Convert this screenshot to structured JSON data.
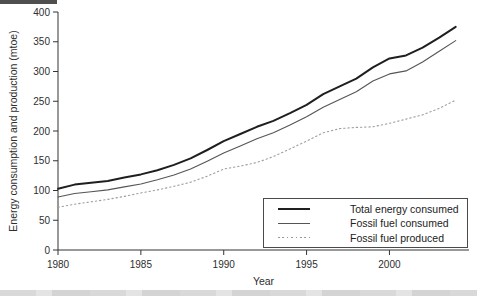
{
  "figure": {
    "y_axis_label": "Energy consumption and production (mtoe)",
    "x_axis_label": "Year",
    "colors": {
      "axis": "#333333",
      "text": "#2e2e2e",
      "total_line": "#1f1f1f",
      "fossil_consumed_line": "#555555",
      "fossil_produced_line": "#9e9e9e",
      "background": "#ffffff"
    }
  },
  "chart_data": {
    "type": "line",
    "title": "",
    "xlabel": "Year",
    "ylabel": "Energy consumption and production (mtoe)",
    "x": [
      1980,
      1981,
      1982,
      1983,
      1984,
      1985,
      1986,
      1987,
      1988,
      1989,
      1990,
      1991,
      1992,
      1993,
      1994,
      1995,
      1996,
      1997,
      1998,
      1999,
      2000,
      2001,
      2002,
      2003,
      2004
    ],
    "series": [
      {
        "name": "Total energy consumed",
        "line_style": "solid-thick",
        "color": "#1f1f1f",
        "values": [
          103,
          110,
          113,
          116,
          122,
          127,
          134,
          143,
          154,
          168,
          183,
          195,
          207,
          217,
          230,
          244,
          262,
          275,
          288,
          307,
          322,
          327,
          340,
          357,
          375
        ]
      },
      {
        "name": "Fossil fuel consumed",
        "line_style": "solid-thin",
        "color": "#555555",
        "values": [
          89,
          95,
          98,
          101,
          106,
          111,
          118,
          126,
          136,
          149,
          163,
          175,
          187,
          197,
          210,
          224,
          240,
          253,
          266,
          284,
          296,
          301,
          316,
          334,
          352
        ]
      },
      {
        "name": "Fossil fuel produced",
        "line_style": "dotted",
        "color": "#9e9e9e",
        "values": [
          72,
          77,
          81,
          85,
          90,
          96,
          101,
          107,
          114,
          124,
          136,
          141,
          147,
          157,
          170,
          183,
          197,
          204,
          206,
          207,
          213,
          220,
          227,
          238,
          252
        ]
      }
    ],
    "xlim": [
      1980,
      2004.8
    ],
    "ylim": [
      0,
      400
    ],
    "xticks": [
      1980,
      1985,
      1990,
      1995,
      2000
    ],
    "yticks": [
      0,
      50,
      100,
      150,
      200,
      250,
      300,
      350,
      400
    ],
    "grid": false,
    "legend_position": "lower right"
  }
}
